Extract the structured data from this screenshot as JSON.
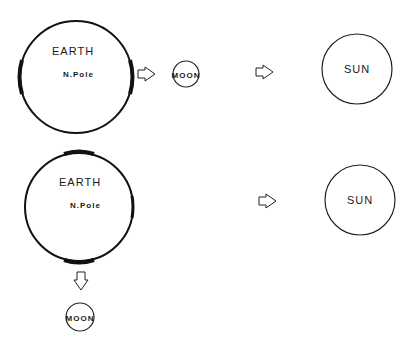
{
  "diagram": {
    "top_row": {
      "earth": {
        "label": "EARTH",
        "sublabel": "N.Pole"
      },
      "moon": {
        "label": "MOON"
      },
      "sun": {
        "label": "SUN"
      }
    },
    "bottom_row": {
      "earth": {
        "label": "EARTH",
        "sublabel": "N.Pole"
      },
      "moon": {
        "label": "MOON"
      },
      "sun": {
        "label": "SUN"
      }
    },
    "icons": {
      "arrow": "hollow-arrow-icon"
    },
    "colors": {
      "stroke": "#111111",
      "background": "#ffffff"
    }
  }
}
